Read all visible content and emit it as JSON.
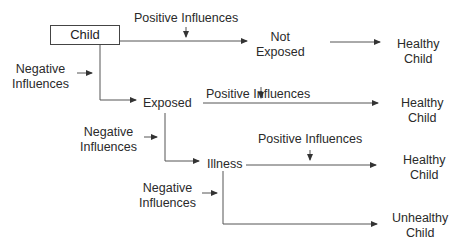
{
  "diagram": {
    "root": {
      "label": "Child"
    },
    "nodes": {
      "not_exposed": {
        "label_line1": "Not",
        "label_line2": "Exposed"
      },
      "exposed": {
        "label": "Exposed"
      },
      "illness": {
        "label": "Illness"
      }
    },
    "outcomes": [
      {
        "line1": "Healthy",
        "line2": "Child"
      },
      {
        "line1": "Healthy",
        "line2": "Child"
      },
      {
        "line1": "Healthy",
        "line2": "Child"
      },
      {
        "line1": "Unhealthy",
        "line2": "Child"
      }
    ],
    "influences": {
      "positive": [
        {
          "label": "Positive Influences"
        },
        {
          "label": "Positive Influences"
        },
        {
          "label": "Positive Influences"
        }
      ],
      "negative": [
        {
          "line1": "Negative",
          "line2": "Influences"
        },
        {
          "line1": "Negative",
          "line2": "Influences"
        },
        {
          "line1": "Negative",
          "line2": "Influences"
        }
      ]
    },
    "colors": {
      "line": "#444444",
      "text": "#2a2a2a"
    }
  }
}
